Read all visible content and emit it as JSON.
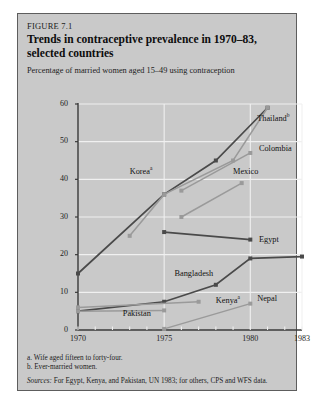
{
  "figure": {
    "number": "FIGURE 7.1",
    "title_line1": "Trends in contraceptive prevalence in 1970–83,",
    "title_line2": "selected countries",
    "subtitle": "Percentage of married women aged 15–49 using contraception",
    "note_a": "a. Wife aged fifteen to forty-four.",
    "note_b": "b. Ever-married women.",
    "source_label": "Sources:",
    "source_text": " For Egypt, Kenya, and Pakistan, UN 1983; for others, CPS and WFS data.",
    "colors": {
      "panel": "#c9c9c9",
      "border": "#5d5d5d",
      "grid": "#f0f0f0",
      "axis": "#3a3a3a",
      "dark_series": "#4a4a4a",
      "light_series": "#9a9a9a"
    }
  },
  "chart_data": {
    "type": "line",
    "title": "Trends in contraceptive prevalence in 1970–83, selected countries",
    "xlabel": "",
    "ylabel": "Percentage of married women aged 15–49 using contraception",
    "xlim": [
      1970,
      1983
    ],
    "ylim": [
      0,
      60
    ],
    "yticks": [
      0,
      10,
      20,
      30,
      40,
      50,
      60
    ],
    "xticks_labeled": [
      1970,
      1975,
      1980,
      1983
    ],
    "xticks_all": [
      1970,
      1971,
      1972,
      1973,
      1974,
      1975,
      1976,
      1977,
      1978,
      1979,
      1980,
      1981,
      1982,
      1983
    ],
    "grid": "horizontal-and-vertical",
    "legend": "inline-labels",
    "series": [
      {
        "name": "Thailand",
        "footnote": "b",
        "style": "dark",
        "label_pos": {
          "x": 1980.4,
          "y": 56.5
        },
        "points": [
          {
            "x": 1970,
            "y": 15
          },
          {
            "x": 1975,
            "y": 36
          },
          {
            "x": 1978,
            "y": 45
          },
          {
            "x": 1981,
            "y": 59
          }
        ]
      },
      {
        "name": "Korea",
        "footnote": "a",
        "style": "light",
        "label_pos": {
          "x": 1973.0,
          "y": 42.5
        },
        "points": [
          {
            "x": 1973,
            "y": 25
          },
          {
            "x": 1975,
            "y": 36
          },
          {
            "x": 1979,
            "y": 45
          },
          {
            "x": 1981,
            "y": 59
          }
        ]
      },
      {
        "name": "Colombia",
        "footnote": "",
        "style": "light",
        "label_pos": {
          "x": 1980.5,
          "y": 48
        },
        "points": [
          {
            "x": 1976,
            "y": 37
          },
          {
            "x": 1980,
            "y": 47
          }
        ]
      },
      {
        "name": "Mexico",
        "footnote": "",
        "style": "light",
        "label_pos": {
          "x": 1979.0,
          "y": 42
        },
        "points": [
          {
            "x": 1976,
            "y": 30
          },
          {
            "x": 1979.5,
            "y": 39
          }
        ]
      },
      {
        "name": "Egypt",
        "footnote": "",
        "style": "dark",
        "label_pos": {
          "x": 1980.5,
          "y": 24
        },
        "points": [
          {
            "x": 1975,
            "y": 26
          },
          {
            "x": 1980,
            "y": 24
          }
        ]
      },
      {
        "name": "Bangladesh",
        "footnote": "",
        "style": "dark",
        "label_pos": {
          "x": 1975.6,
          "y": 15
        },
        "points": [
          {
            "x": 1970,
            "y": 5
          },
          {
            "x": 1975,
            "y": 7.5
          },
          {
            "x": 1978,
            "y": 12
          },
          {
            "x": 1980,
            "y": 19
          },
          {
            "x": 1983,
            "y": 19.5
          }
        ]
      },
      {
        "name": "Kenya",
        "footnote": "a",
        "style": "light",
        "label_pos": {
          "x": 1978.0,
          "y": 8.3
        },
        "points": [
          {
            "x": 1970,
            "y": 6
          },
          {
            "x": 1977,
            "y": 7.5
          }
        ]
      },
      {
        "name": "Pakistan",
        "footnote": "",
        "style": "light",
        "label_pos": {
          "x": 1972.6,
          "y": 4.2
        },
        "points": [
          {
            "x": 1970,
            "y": 5
          },
          {
            "x": 1975,
            "y": 5.2
          }
        ]
      },
      {
        "name": "Nepal",
        "footnote": "",
        "style": "light",
        "label_pos": {
          "x": 1980.4,
          "y": 8.3
        },
        "points": [
          {
            "x": 1975,
            "y": 0.3
          },
          {
            "x": 1980,
            "y": 7
          }
        ]
      }
    ]
  }
}
